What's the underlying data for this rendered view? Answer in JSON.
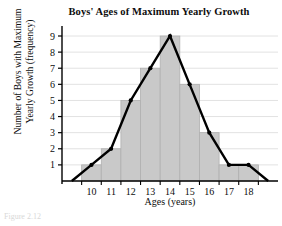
{
  "chart_data": {
    "type": "bar",
    "title": "Boys' Ages of Maximum Yearly Growth",
    "xlabel": "Ages (years)",
    "ylabel_line1": "Number of Boys with Maximum",
    "ylabel_line2": "Yearly Growth (frequency)",
    "categories": [
      10,
      11,
      12,
      13,
      14,
      15,
      16,
      17,
      18
    ],
    "values": [
      1,
      2,
      5,
      7,
      9,
      6,
      3,
      1,
      1
    ],
    "xtick_labels": [
      "10",
      "11",
      "12",
      "13",
      "14",
      "15",
      "16",
      "17",
      "18"
    ],
    "ytick_labels": [
      "1",
      "2",
      "3",
      "4",
      "5",
      "6",
      "7",
      "8",
      "9"
    ],
    "ytick_values": [
      1,
      2,
      3,
      4,
      5,
      6,
      7,
      8,
      9
    ],
    "xlim": [
      8.5,
      19.5
    ],
    "ylim": [
      0,
      9.6
    ],
    "grid": true,
    "legend": "none",
    "overlay": {
      "type": "line",
      "name": "frequency polygon",
      "x": [
        9,
        10,
        11,
        12,
        13,
        14,
        15,
        16,
        17,
        18,
        19
      ],
      "y": [
        0,
        1,
        2,
        5,
        7,
        9,
        6,
        3,
        1,
        1,
        0
      ],
      "markers": true
    },
    "colors": {
      "bar_fill": "#c9c9c9",
      "bar_edge": "#b0b0b0",
      "line": "#000000",
      "grid": "#e2e2e2",
      "axis": "#000000",
      "text": "#0d0d0d"
    }
  },
  "caption": "Figure 2.12"
}
